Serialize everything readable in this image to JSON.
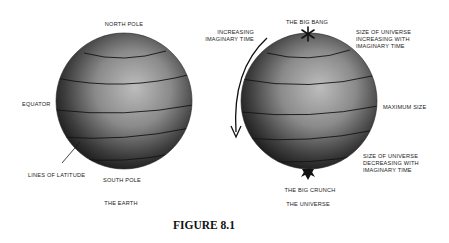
{
  "figure": {
    "caption": "FIGURE 8.1"
  },
  "earth": {
    "title": "THE EARTH",
    "labels": {
      "north_pole": "NORTH POLE",
      "south_pole": "SOUTH POLE",
      "equator": "EQUATOR",
      "lines_of_latitude": "LINES OF LATITUDE"
    }
  },
  "universe": {
    "title": "THE UNIVERSE",
    "labels": {
      "big_bang": "THE BIG BANG",
      "big_crunch": "THE BIG CRUNCH",
      "maximum_size": "MAXIMUM SIZE",
      "increasing_time": [
        "INCREASING",
        "IMAGINARY TIME"
      ],
      "size_increasing": [
        "SIZE OF UNIVERSE",
        "INCREASING WITH",
        "IMAGINARY TIME"
      ],
      "size_decreasing": [
        "SIZE OF UNIVERSE",
        "DECREASING WITH",
        "IMAGINARY TIME"
      ]
    },
    "markers": {
      "big_bang": "asterisk-icon",
      "big_crunch": "spike-icon",
      "time_direction": "curved-arrow-icon"
    }
  },
  "colors": {
    "sphere_light": "#b9b9b9",
    "sphere_mid": "#7a7a7a",
    "sphere_dark": "#1e1e1e",
    "line": "#141414"
  }
}
